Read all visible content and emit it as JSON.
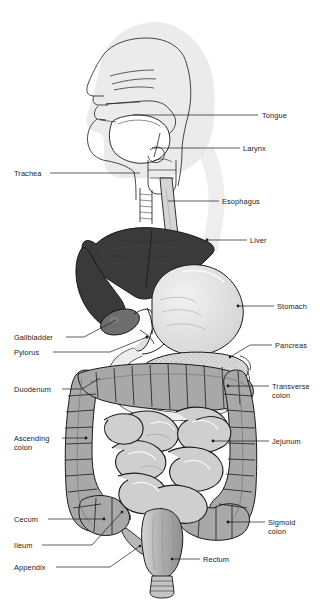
{
  "figure": {
    "type": "anatomical-diagram",
    "background_color": "#ffffff",
    "canvas": {
      "width": 326,
      "height": 607
    },
    "palette": {
      "outline": "#1a1a1a",
      "label_text": "#1a1a1a",
      "head_silhouette": "#e8e8e8",
      "liver_fill": "#3a3a3a",
      "gallbladder_fill": "#6e6e6e",
      "stomach_fill": "#e0e0e0",
      "colon_fill": "#a8a8a8",
      "small_intestine_fill": "#cfcfcf",
      "pancreas_fill": "#d8d8d8",
      "esophagus_fill": "#d5d5d5",
      "rectum_fill": "#b4b4b4"
    }
  },
  "labels": [
    {
      "id": "tongue",
      "text": "Tongue",
      "lines": [
        "Tongue"
      ],
      "side": "right",
      "text_x": 262,
      "text_y": 118,
      "leader": "M 258 115 L 216 115 L 133 115",
      "point_x": 133,
      "point_y": 115
    },
    {
      "id": "larynx",
      "text": "Larynx",
      "lines": [
        "Larynx"
      ],
      "side": "right",
      "text_x": 243,
      "text_y": 151,
      "leader": "M 240 148 L 152 148",
      "point_x": 152,
      "point_y": 148
    },
    {
      "id": "trachea",
      "text": "Trachea",
      "lines": [
        "Trachea"
      ],
      "side": "left",
      "text_x": 14,
      "text_y": 176,
      "leader": "M 50 173 L 140 173",
      "point_x": 140,
      "point_y": 173
    },
    {
      "id": "esophagus",
      "text": "Esophagus",
      "lines": [
        "Esophagus"
      ],
      "side": "right",
      "text_x": 222,
      "text_y": 204,
      "leader": "M 219 201 L 168 201",
      "point_x": 168,
      "point_y": 201
    },
    {
      "id": "liver",
      "text": "Liver",
      "lines": [
        "Liver"
      ],
      "side": "right",
      "text_x": 250,
      "text_y": 243,
      "leader": "M 247 240 L 207 240",
      "point_x": 207,
      "point_y": 240
    },
    {
      "id": "stomach",
      "text": "Stomach",
      "lines": [
        "Stomach"
      ],
      "side": "right",
      "text_x": 277,
      "text_y": 309,
      "leader": "M 274 306 L 238 306",
      "point_x": 238,
      "point_y": 306
    },
    {
      "id": "gallbladder",
      "text": "Gallbladder",
      "lines": [
        "Gallbladder"
      ],
      "side": "left",
      "text_x": 14,
      "text_y": 340,
      "leader": "M 66 337 L 84 337 L 116 320",
      "point_x": 116,
      "point_y": 320
    },
    {
      "id": "pylorus",
      "text": "Pylorus",
      "lines": [
        "Pylorus"
      ],
      "side": "left",
      "text_x": 14,
      "text_y": 355,
      "leader": "M 53 352 L 110 352 L 147 337",
      "point_x": 147,
      "point_y": 337
    },
    {
      "id": "pancreas",
      "text": "Pancreas",
      "lines": [
        "Pancreas"
      ],
      "side": "right",
      "text_x": 275,
      "text_y": 348,
      "leader": "M 272 345 L 250 345 L 230 357",
      "point_x": 230,
      "point_y": 357
    },
    {
      "id": "duodenum",
      "text": "Duodenum",
      "lines": [
        "Duodenum"
      ],
      "side": "left",
      "text_x": 14,
      "text_y": 392,
      "leader": "M 62 389 L 82 389 L 100 378",
      "point_x": 100,
      "point_y": 378
    },
    {
      "id": "transverse-colon",
      "text": "Transverse colon",
      "lines": [
        "Transverse",
        "colon"
      ],
      "side": "right",
      "text_x": 272,
      "text_y": 389,
      "leader": "M 269 386 L 228 386",
      "point_x": 228,
      "point_y": 386
    },
    {
      "id": "ascending-colon",
      "text": "Ascending colon",
      "lines": [
        "Ascending",
        "colon"
      ],
      "side": "left",
      "text_x": 14,
      "text_y": 441,
      "leader": "M 62 438 L 86 438",
      "point_x": 86,
      "point_y": 438
    },
    {
      "id": "jejunum",
      "text": "Jejunum",
      "lines": [
        "Jejunum"
      ],
      "side": "right",
      "text_x": 272,
      "text_y": 444,
      "leader": "M 269 441 L 213 441",
      "point_x": 213,
      "point_y": 441
    },
    {
      "id": "cecum",
      "text": "Cecum",
      "lines": [
        "Cecum"
      ],
      "side": "left",
      "text_x": 14,
      "text_y": 522,
      "leader": "M 48 519 L 104 519",
      "point_x": 104,
      "point_y": 519
    },
    {
      "id": "sigmoid-colon",
      "text": "Sigmoid colon",
      "lines": [
        "Sigmoid",
        "colon"
      ],
      "side": "right",
      "text_x": 268,
      "text_y": 525,
      "leader": "M 265 522 L 228 522",
      "point_x": 228,
      "point_y": 522
    },
    {
      "id": "ileum",
      "text": "Ileum",
      "lines": [
        "Ileum"
      ],
      "side": "left",
      "text_x": 14,
      "text_y": 548,
      "leader": "M 42 545 L 92 545 L 122 512",
      "point_x": 122,
      "point_y": 512
    },
    {
      "id": "rectum",
      "text": "Rectum",
      "lines": [
        "Rectum"
      ],
      "side": "right",
      "text_x": 203,
      "text_y": 562,
      "leader": "M 200 559 L 172 559",
      "point_x": 172,
      "point_y": 559
    },
    {
      "id": "appendix",
      "text": "Appendix",
      "lines": [
        "Appendix"
      ],
      "side": "left",
      "text_x": 14,
      "text_y": 570,
      "leader": "M 56 567 L 110 567 L 140 546",
      "point_x": 140,
      "point_y": 546
    }
  ]
}
